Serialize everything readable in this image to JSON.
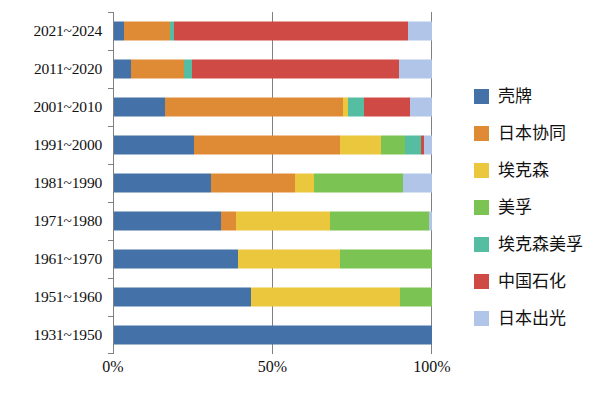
{
  "chart_data": {
    "type": "bar",
    "orientation": "horizontal",
    "stacked": true,
    "normalized": true,
    "title": "",
    "xlabel": "",
    "ylabel": "",
    "xlim": [
      0,
      100
    ],
    "x_ticks": [
      "0%",
      "50%",
      "100%"
    ],
    "x_tick_values": [
      0,
      50,
      100
    ],
    "grid": "vertical-midline",
    "legend_position": "right",
    "categories": [
      "2021~2024",
      "2011~2020",
      "2001~2010",
      "1991~2000",
      "1981~1990",
      "1971~1980",
      "1961~1970",
      "1951~1960",
      "1931~1950"
    ],
    "series": [
      {
        "name": "壳牌",
        "color": "#4472a8",
        "values": [
          3.0,
          5.5,
          16.0,
          25.0,
          30.5,
          33.5,
          39.0,
          43.0,
          100.0
        ]
      },
      {
        "name": "日本协同",
        "color": "#df8b35",
        "values": [
          14.5,
          16.5,
          56.0,
          46.0,
          26.5,
          5.0,
          0.0,
          0.0,
          0.0
        ]
      },
      {
        "name": "埃克森",
        "color": "#ebc73d",
        "values": [
          0.0,
          0.0,
          1.5,
          13.0,
          6.0,
          29.5,
          32.0,
          47.0,
          0.0
        ]
      },
      {
        "name": "美孚",
        "color": "#7bc352",
        "values": [
          0.0,
          0.0,
          0.0,
          7.5,
          28.0,
          31.0,
          29.0,
          10.0,
          0.0
        ]
      },
      {
        "name": "埃克森美孚",
        "color": "#55bda2",
        "values": [
          1.5,
          2.5,
          5.0,
          5.0,
          0.0,
          0.0,
          0.0,
          0.0,
          0.0
        ]
      },
      {
        "name": "中国石化",
        "color": "#cf4a45",
        "values": [
          73.5,
          65.0,
          14.5,
          1.0,
          0.0,
          0.0,
          0.0,
          0.0,
          0.0
        ]
      },
      {
        "name": "日本出光",
        "color": "#b0c5e8",
        "values": [
          7.5,
          10.5,
          7.0,
          2.5,
          9.0,
          1.0,
          0.0,
          0.0,
          0.0
        ]
      }
    ]
  },
  "legend": {
    "items": [
      {
        "label": "壳牌",
        "color": "#4472a8"
      },
      {
        "label": "日本协同",
        "color": "#df8b35"
      },
      {
        "label": "埃克森",
        "color": "#ebc73d"
      },
      {
        "label": "美孚",
        "color": "#7bc352"
      },
      {
        "label": "埃克森美孚",
        "color": "#55bda2"
      },
      {
        "label": "中国石化",
        "color": "#cf4a45"
      },
      {
        "label": "日本出光",
        "color": "#b0c5e8"
      }
    ]
  },
  "axis": {
    "x_tick_labels": [
      "0%",
      "50%",
      "100%"
    ],
    "y_tick_labels": [
      "2021~2024",
      "2011~2020",
      "2001~2010",
      "1991~2000",
      "1981~1990",
      "1971~1980",
      "1961~1970",
      "1951~1960",
      "1931~1950"
    ]
  },
  "colors": {
    "axis_line": "#808080",
    "text": "#111111",
    "background": "#ffffff"
  }
}
